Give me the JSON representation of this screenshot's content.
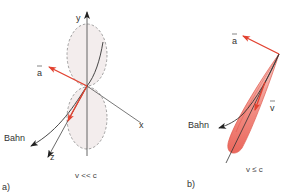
{
  "panel_a": {
    "caption": "a)",
    "condition": "v << c",
    "axis_labels": {
      "x": "x",
      "y": "y",
      "z": "z"
    },
    "vector_label": "a",
    "trajectory_label": "Bahn"
  },
  "panel_b": {
    "caption": "b)",
    "condition": "v ≤ c",
    "acceleration_label": "a",
    "velocity_label": "v",
    "trajectory_label": "Bahn"
  },
  "colors": {
    "vector_red": "#e2412f",
    "lobe_fill_light": "#f3eded",
    "lobe_fill_red": "#ee6d62",
    "axis": "#555555",
    "dashed": "#8a8a8a",
    "text": "#333333"
  }
}
